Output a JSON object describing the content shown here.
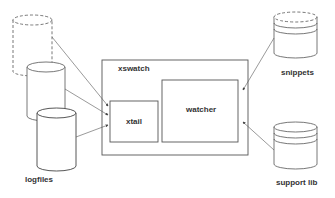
{
  "diagram": {
    "nodes": {
      "logfiles": {
        "label": "logfiles"
      },
      "xswatch": {
        "label": "xswatch"
      },
      "xtail": {
        "label": "xtail"
      },
      "watcher": {
        "label": "watcher"
      },
      "snippets": {
        "label": "snippets"
      },
      "support_lib": {
        "label": "support lib"
      }
    },
    "edges": [
      {
        "from": "logfiles-1",
        "to": "xtail"
      },
      {
        "from": "logfiles-2",
        "to": "xtail"
      },
      {
        "from": "logfiles-3",
        "to": "xtail"
      },
      {
        "from": "snippets",
        "to": "watcher"
      },
      {
        "from": "support_lib",
        "to": "watcher"
      }
    ]
  }
}
